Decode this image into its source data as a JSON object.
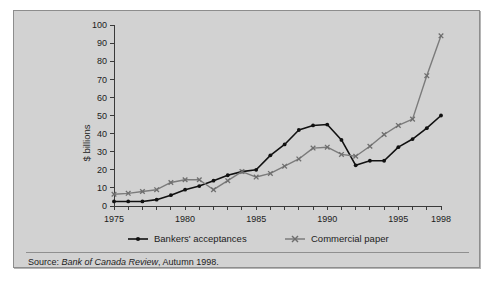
{
  "figure": {
    "source_prefix": "Source:",
    "source_italic": "Bank of Canada Review",
    "source_suffix": ", Autumn 1998.",
    "background_color": "#d2d2d2",
    "border_color": "#8d8d8d"
  },
  "legend": {
    "entries": [
      {
        "label": "Bankers' acceptances",
        "color": "#111111",
        "marker": "dot"
      },
      {
        "label": "Commercial paper",
        "color": "#7b7b7b",
        "marker": "cross"
      }
    ]
  },
  "chart_data": {
    "type": "line",
    "title": "",
    "xlabel": "",
    "ylabel": "$ billions",
    "xlim": [
      1975,
      1998
    ],
    "ylim": [
      0,
      100
    ],
    "ytick_step": 10,
    "yticks": [
      0,
      10,
      20,
      30,
      40,
      50,
      60,
      70,
      80,
      90,
      100
    ],
    "ytick_labels": [
      "0",
      "10",
      "20",
      "30",
      "40",
      "50",
      "60",
      "70",
      "80",
      "90",
      "100"
    ],
    "xticks": [
      1975,
      1976,
      1977,
      1978,
      1979,
      1980,
      1981,
      1982,
      1983,
      1984,
      1985,
      1986,
      1987,
      1988,
      1989,
      1990,
      1991,
      1992,
      1993,
      1994,
      1995,
      1996,
      1997,
      1998
    ],
    "xtick_labels_shown": [
      "1975",
      "1980",
      "1985",
      "1990",
      "1995",
      "1998"
    ],
    "xtick_labeled_values": [
      1975,
      1980,
      1985,
      1990,
      1995,
      1998
    ],
    "grid": false,
    "legend_position": "below-axis",
    "x": [
      1975,
      1976,
      1977,
      1978,
      1979,
      1980,
      1981,
      1982,
      1983,
      1984,
      1985,
      1986,
      1987,
      1988,
      1989,
      1990,
      1991,
      1992,
      1993,
      1994,
      1995,
      1996,
      1997,
      1998
    ],
    "series": [
      {
        "name": "Bankers' acceptances",
        "color": "#111111",
        "marker": "dot",
        "values": [
          2.5,
          2.5,
          2.5,
          3.5,
          6,
          9,
          11,
          14,
          17,
          19,
          20,
          28,
          34,
          42,
          44.5,
          45,
          36.5,
          22.5,
          25,
          25,
          32.5,
          37,
          43,
          50
        ]
      },
      {
        "name": "Commercial paper",
        "color": "#7b7b7b",
        "marker": "cross",
        "values": [
          6.5,
          7,
          8,
          9,
          13,
          14.5,
          14.5,
          9,
          14,
          19,
          16,
          18,
          22,
          26,
          32,
          32.5,
          28.5,
          27.5,
          33,
          39.5,
          44.5,
          48,
          72,
          94
        ]
      }
    ]
  }
}
